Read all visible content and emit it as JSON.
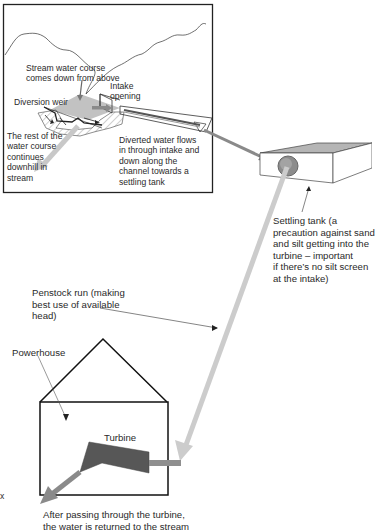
{
  "diagram": {
    "colors": {
      "frame": "#222222",
      "arrow_dark": "#7a7a7a",
      "arrow_light": "#c8c8c8",
      "weir_fill": "#bdbdbd",
      "tank_top": "#b5b5b5",
      "turbine_fill": "#5e5e5e"
    },
    "labels": {
      "stream": "Stream water course\ncomes down from above",
      "intake": "Intake\nopening",
      "weir": "Diversion weir",
      "rest_of_water": "The rest of the\nwater course\ncontinues\ndownhill in\nstream",
      "diverted": "Diverted water flows\nin through intake and\ndown along the\nchannel towards a\nsettling tank",
      "settling_tank": "Settling tank (a\nprecaution against sand\nand silt getting into the\nturbine – important\nif there’s no silt screen\nat the intake)",
      "penstock": "Penstock run (making\nbest use of available\nhead)",
      "powerhouse": "Powerhouse",
      "turbine": "Turbine",
      "return": "After passing through the turbine,\nthe water is returned to the stream",
      "edge_fragment": "x"
    }
  }
}
